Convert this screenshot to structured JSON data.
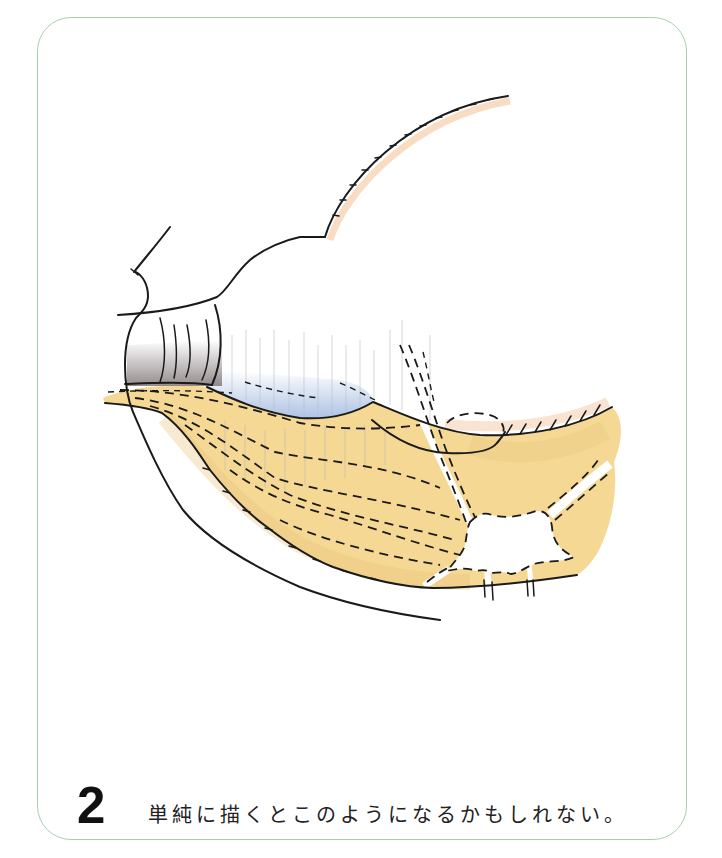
{
  "figure": {
    "number": "2",
    "caption": "単純に描くとこのようになるかもしれない。"
  },
  "illustration": {
    "palette": {
      "frame_border": "#a8d0b0",
      "fat_yellow": "#f4d894",
      "fat_yellow_dark": "#e8c27a",
      "blue_shade": "#a9bfe2",
      "grey_shade": "#7a6f71",
      "orange_tint": "#f2b27c",
      "ink": "#1a1a1a",
      "paper": "#ffffff"
    }
  }
}
